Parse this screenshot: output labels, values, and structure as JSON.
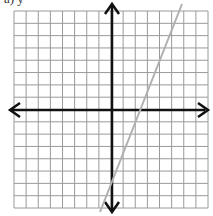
{
  "caption": "a) y = ",
  "graph": {
    "grid": {
      "columns": 16,
      "rows": 16,
      "x_min": -8,
      "x_max": 8,
      "y_min": -8,
      "y_max": 8
    },
    "axes": {
      "x_axis": "horizontal with arrows",
      "y_axis": "vertical with arrows"
    },
    "line": {
      "color": "#b0b0b0",
      "x_intercept_approx": 2.3,
      "y_intercept_approx": -6
    }
  },
  "colors": {
    "grid": "#9a9a9a",
    "axes": "#111111",
    "line": "#b0b0b0"
  }
}
